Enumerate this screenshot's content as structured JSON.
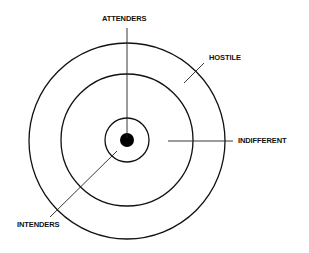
{
  "diagram": {
    "type": "concentric-circles",
    "center": {
      "x": 127,
      "y": 141
    },
    "rings": [
      {
        "name": "outer",
        "radius": 98
      },
      {
        "name": "middle",
        "radius": 66
      },
      {
        "name": "inner",
        "radius": 22
      }
    ],
    "core_dot_radius": 7,
    "stroke_color": "#111111",
    "labels": {
      "attenders": "ATTENDERS",
      "hostile": "HOSTILE",
      "indifferent": "INDIFFERENT",
      "intenders": "INTENDERS"
    }
  }
}
